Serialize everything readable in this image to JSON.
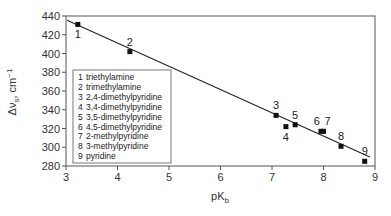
{
  "chart_data": {
    "type": "scatter",
    "title": "",
    "xlabel": "pK",
    "xlabel_sub": "b",
    "ylabel": "Δν",
    "ylabel_sub": "s",
    "ylabel_suffix": ", cm",
    "ylabel_sup": "−1",
    "xlim": [
      3,
      9
    ],
    "ylim": [
      280,
      440
    ],
    "xticks": [
      3,
      4,
      5,
      6,
      7,
      8,
      9
    ],
    "yticks": [
      280,
      300,
      320,
      340,
      360,
      380,
      400,
      420,
      440
    ],
    "grid": false,
    "points": [
      {
        "id": "1",
        "x": 3.23,
        "y": 431,
        "label_pos": "below"
      },
      {
        "id": "2",
        "x": 4.24,
        "y": 402,
        "label_pos": "above"
      },
      {
        "id": "3",
        "x": 7.08,
        "y": 334,
        "label_pos": "above"
      },
      {
        "id": "4",
        "x": 7.27,
        "y": 322,
        "label_pos": "below"
      },
      {
        "id": "5",
        "x": 7.45,
        "y": 324,
        "label_pos": "above"
      },
      {
        "id": "6",
        "x": 7.95,
        "y": 317,
        "label_pos": "above-left"
      },
      {
        "id": "7",
        "x": 8.0,
        "y": 317,
        "label_pos": "above-right"
      },
      {
        "id": "8",
        "x": 8.34,
        "y": 301,
        "label_pos": "above"
      },
      {
        "id": "9",
        "x": 8.8,
        "y": 285,
        "label_pos": "above"
      }
    ],
    "fit_line": {
      "x": [
        3.02,
        8.9
      ],
      "y": [
        435.5,
        289.5
      ]
    },
    "legend": {
      "position": "center-left",
      "entries": [
        {
          "num": "1",
          "name": "triethylamine"
        },
        {
          "num": "2",
          "name": "trimethylamine"
        },
        {
          "num": "3",
          "name": "2,4-dimethylpyridine"
        },
        {
          "num": "4",
          "name": "3,4-dimethylpyridine"
        },
        {
          "num": "5",
          "name": "3,5-dimethylpyridine"
        },
        {
          "num": "6",
          "name": "4,5-dimethylpyridine"
        },
        {
          "num": "7",
          "name": "2-methylpyridine"
        },
        {
          "num": "8",
          "name": "3-methylpyridine"
        },
        {
          "num": "9",
          "name": "pyridine"
        }
      ]
    },
    "colors": {
      "marker": "#111111",
      "line": "#222222",
      "axis": "#444444"
    }
  }
}
